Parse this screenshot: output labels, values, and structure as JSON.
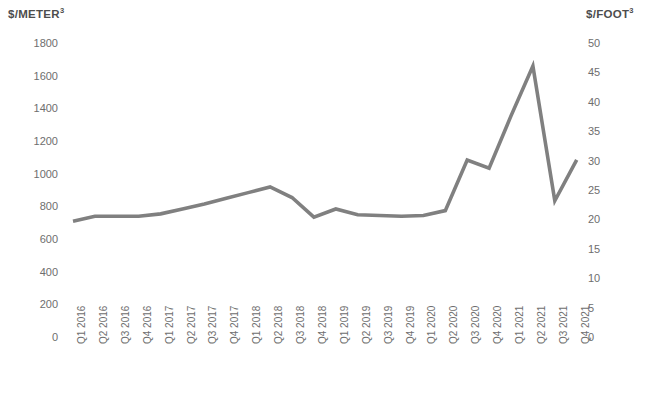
{
  "chart_data": {
    "type": "line",
    "title": "",
    "xlabel": "",
    "ylabel": "$/METER³",
    "ylabel_secondary": "$/FOOT³",
    "grid": false,
    "legend": "none",
    "line_color": "#808080",
    "categories": [
      "Q1 2016",
      "Q2 2016",
      "Q3 2016",
      "Q4 2016",
      "Q1 2017",
      "Q2 2017",
      "Q3 2017",
      "Q4 2017",
      "Q1 2018",
      "Q2 2018",
      "Q3 2018",
      "Q4 2018",
      "Q1 2019",
      "Q2 2019",
      "Q3 2019",
      "Q4 2019",
      "Q1 2020",
      "Q2 2020",
      "Q3 2020",
      "Q4 2020",
      "Q1 2021",
      "Q2 2021",
      "Q3 2021",
      "Q4 2021"
    ],
    "values": [
      715,
      745,
      745,
      745,
      760,
      790,
      820,
      855,
      890,
      925,
      860,
      740,
      790,
      755,
      750,
      745,
      750,
      780,
      1090,
      1040,
      1360,
      1665,
      840,
      1090
    ],
    "ylim": [
      0,
      1800
    ],
    "yticks": [
      0,
      200,
      400,
      600,
      800,
      1000,
      1200,
      1400,
      1600,
      1800
    ],
    "ylim_secondary": [
      0,
      50
    ],
    "yticks_secondary": [
      0,
      5,
      10,
      15,
      20,
      25,
      30,
      35,
      40,
      45,
      50
    ],
    "axis": {
      "left_tick_labels": [
        "1800",
        "1600",
        "1400",
        "1200",
        "1000",
        "800",
        "600",
        "400",
        "200",
        "0"
      ],
      "right_tick_labels": [
        "50",
        "45",
        "40",
        "35",
        "30",
        "25",
        "20",
        "15",
        "10",
        "5",
        "0"
      ]
    }
  }
}
